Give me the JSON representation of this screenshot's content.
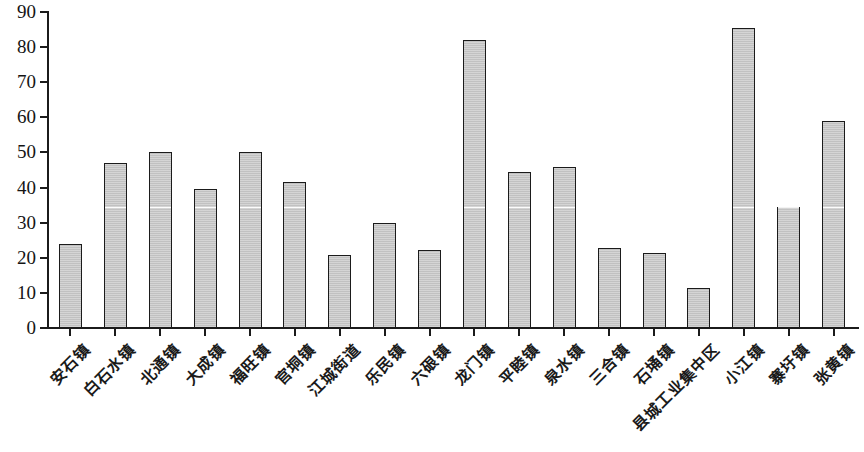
{
  "chart_data": {
    "type": "bar",
    "title": "",
    "subtitle": "",
    "xlabel": "",
    "ylabel": "",
    "ylim": [
      0,
      90
    ],
    "ytick_step": 10,
    "yticks": [
      0,
      10,
      20,
      30,
      40,
      50,
      60,
      70,
      80,
      90
    ],
    "ytick_labels": [
      "0",
      "10",
      "20",
      "30",
      "40",
      "50",
      "60",
      "70",
      "80",
      "90"
    ],
    "grid": false,
    "legend": null,
    "bar_fill_color": "#c9c9c9",
    "bar_edge_color": "#1b1b1b",
    "axis_color": "#1b1b1b",
    "categories": [
      "安石镇",
      "白石水镇",
      "北通镇",
      "大成镇",
      "福旺镇",
      "官垌镇",
      "江城街道",
      "乐民镇",
      "六硍镇",
      "龙门镇",
      "平睦镇",
      "泉水镇",
      "三合镇",
      "石埇镇",
      "县城工业集中区",
      "小江镇",
      "寨圩镇",
      "张黄镇"
    ],
    "values": [
      24,
      47,
      50,
      39.5,
      50,
      41.5,
      20.8,
      30,
      22.2,
      82,
      44.5,
      46,
      22.7,
      21.5,
      11.5,
      85.5,
      34.5,
      59
    ]
  }
}
